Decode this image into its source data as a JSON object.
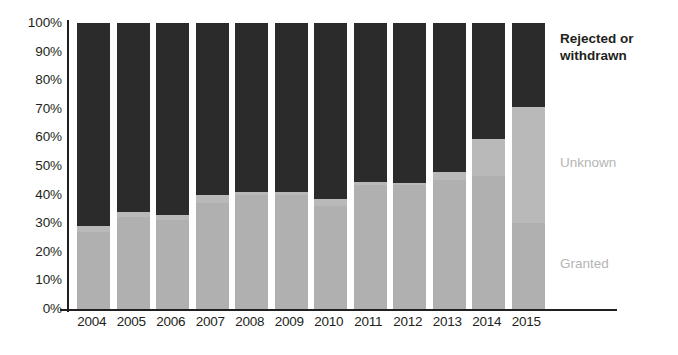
{
  "chart_data": {
    "type": "bar",
    "subtype": "stacked-bar-100-percent",
    "title": "",
    "subtitle": "",
    "xlabel": "",
    "ylabel": "",
    "ylim": [
      0,
      100
    ],
    "grid": false,
    "legend_position": "right",
    "categories": [
      "2004",
      "2005",
      "2006",
      "2007",
      "2008",
      "2009",
      "2010",
      "2011",
      "2012",
      "2013",
      "2014",
      "2015"
    ],
    "y_ticks": [
      "0%",
      "10%",
      "20%",
      "30%",
      "40%",
      "50%",
      "60%",
      "70%",
      "80%",
      "90%",
      "100%"
    ],
    "y_tick_values": [
      0,
      10,
      20,
      30,
      40,
      50,
      60,
      70,
      80,
      90,
      100
    ],
    "series": [
      {
        "name": "Granted",
        "color": "#b0b0b0",
        "values": [
          27,
          32,
          31,
          37,
          40,
          40,
          36,
          43.5,
          43.5,
          45,
          46.5,
          30
        ]
      },
      {
        "name": "Unknown",
        "color": "#b9b9b9",
        "values": [
          2,
          2,
          2,
          3,
          1,
          1,
          2.5,
          1,
          0.5,
          3,
          13,
          40.5
        ]
      },
      {
        "name": "Rejected or withdrawn",
        "color": "#2b2b2b",
        "values": [
          71,
          66,
          67,
          60,
          59,
          59,
          61.5,
          55.5,
          56,
          52,
          40.5,
          29.5
        ]
      }
    ]
  },
  "legend": {
    "rejected_label": "Rejected or withdrawn",
    "unknown_label": "Unknown",
    "granted_label": "Granted"
  }
}
